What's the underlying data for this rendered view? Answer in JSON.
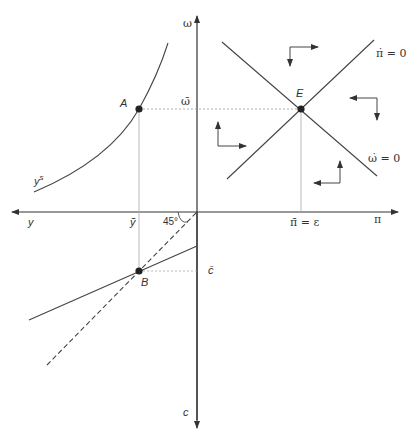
{
  "diagram": {
    "type": "phase-diagram",
    "axes": {
      "vertical_top": "ω",
      "vertical_bottom": "c",
      "horizontal_left": "y",
      "horizontal_right": "π"
    },
    "curves": {
      "supply_curve": "y",
      "supply_curve_sup": "s",
      "pi_dot_locus": "π̇ = 0",
      "omega_dot_locus": "ω̇ = 0"
    },
    "points": {
      "A": "A",
      "B": "B",
      "E": "E"
    },
    "ticks": {
      "omega_bar": "ω̄",
      "y_tilde": "ỹ",
      "c_bar": "c̄",
      "pi_bar": "π̄ = ε"
    },
    "angle_label": "45°"
  }
}
